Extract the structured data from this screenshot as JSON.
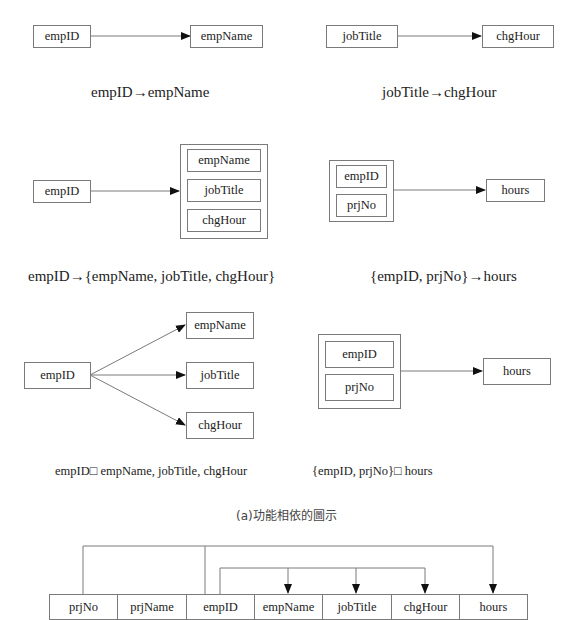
{
  "diagram": {
    "section1": {
      "left": {
        "from": "empID",
        "to": "empName",
        "caption": "empID→empName"
      },
      "right": {
        "from": "jobTitle",
        "to": "chgHour",
        "caption": "jobTitle→chgHour"
      }
    },
    "section2": {
      "left": {
        "from": "empID",
        "to_group": [
          "empName",
          "jobTitle",
          "chgHour"
        ],
        "caption": "empID→{empName, jobTitle, chgHour}"
      },
      "right": {
        "from_group": [
          "empID",
          "prjNo"
        ],
        "to": "hours",
        "caption": "{empID, prjNo}→hours"
      }
    },
    "section3": {
      "left": {
        "from": "empID",
        "targets": [
          "empName",
          "jobTitle",
          "chgHour"
        ],
        "caption": "empID□ empName, jobTitle, chgHour"
      },
      "right": {
        "from_group": [
          "empID",
          "prjNo"
        ],
        "to": "hours",
        "caption": "{empID, prjNo}□ hours"
      }
    },
    "figure_caption": "(a)功能相依的圖示",
    "relation_table": {
      "columns": [
        "prjNo",
        "prjName",
        "empID",
        "empName",
        "jobTitle",
        "chgHour",
        "hours"
      ]
    },
    "colors": {
      "line": "#7a7a7a",
      "arrowhead": "#111111",
      "text": "#222222"
    }
  }
}
